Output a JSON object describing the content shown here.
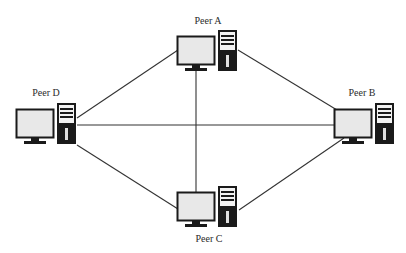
{
  "diagram": {
    "colors": {
      "background": "#ffffff",
      "line": "#333333",
      "monitor_screen": "#e6e6e6",
      "monitor_frame": "#1a1a1a",
      "tower_body": "#1a1a1a",
      "tower_face": "#f2f2f2"
    },
    "nodes": [
      {
        "id": "A",
        "label": "Peer A",
        "type": "desktop-computer"
      },
      {
        "id": "B",
        "label": "Peer B",
        "type": "desktop-computer"
      },
      {
        "id": "C",
        "label": "Peer C",
        "type": "desktop-computer"
      },
      {
        "id": "D",
        "label": "Peer D",
        "type": "desktop-computer"
      }
    ],
    "edges": [
      {
        "from": "A",
        "to": "B"
      },
      {
        "from": "A",
        "to": "C"
      },
      {
        "from": "A",
        "to": "D"
      },
      {
        "from": "B",
        "to": "C"
      },
      {
        "from": "B",
        "to": "D"
      },
      {
        "from": "C",
        "to": "D"
      }
    ]
  }
}
